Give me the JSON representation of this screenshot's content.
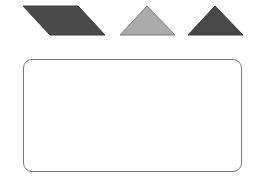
{
  "shapes": [
    {
      "type": "parallelogram",
      "fill": "#4a4a4a",
      "stroke": "#3a3a3a",
      "points": "23,6 78,6 105,35 50,35"
    },
    {
      "type": "triangle",
      "fill": "#ababab",
      "stroke": "#7a7a7a",
      "points": "147,6 175,35 120,35"
    },
    {
      "type": "triangle",
      "fill": "#484848",
      "stroke": "#3a3a3a",
      "points": "215,6 243,35 188,35"
    }
  ],
  "target_area": {
    "border": "#7a7a7a",
    "fill": "#ffffff"
  }
}
